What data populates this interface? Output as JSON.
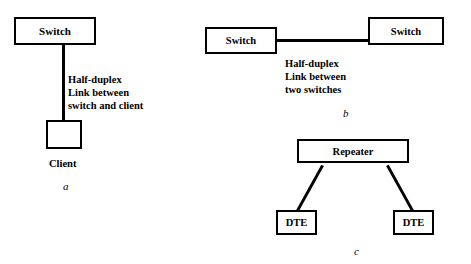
{
  "diagram": {
    "type": "network-diagram",
    "panels": [
      {
        "id": "a",
        "caption": "a",
        "nodes": [
          {
            "name": "switch-a",
            "label": "Switch"
          },
          {
            "name": "client-a",
            "label": ""
          }
        ],
        "node_caption": "Client",
        "annotation": "Half-duplex\nLink between\nswitch and client"
      },
      {
        "id": "b",
        "caption": "b",
        "nodes": [
          {
            "name": "switch-b-left",
            "label": "Switch"
          },
          {
            "name": "switch-b-right",
            "label": "Switch"
          }
        ],
        "annotation": "Half-duplex\nLink between\ntwo switches"
      },
      {
        "id": "c",
        "caption": "c",
        "nodes": [
          {
            "name": "repeater-c",
            "label": "Repeater"
          },
          {
            "name": "dte-c-left",
            "label": "DTE"
          },
          {
            "name": "dte-c-right",
            "label": "DTE"
          }
        ],
        "annotation": ""
      }
    ]
  },
  "colors": {
    "stroke": "#000000",
    "fill": "#ffffff",
    "text": "#000000"
  }
}
